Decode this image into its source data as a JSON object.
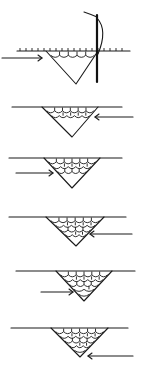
{
  "diagram": {
    "title": "",
    "type": "welding-pass-sequence",
    "canvas": {
      "width": 146,
      "height": 373,
      "background": "#ffffff",
      "ink": "#1a1a1a"
    },
    "panels": [
      {
        "step": 1,
        "surface": {
          "y": 51,
          "x1": 17,
          "x2": 130
        },
        "groove": {
          "left": 46,
          "right": 98,
          "apex_x": 76,
          "apex_y": 84
        },
        "fill_rows": 1,
        "arrow": {
          "direction": "right",
          "x1": 2,
          "x2": 42,
          "y": 58
        },
        "electrode": {
          "x": 97,
          "y1": 15,
          "y2": 82
        },
        "scallops_on_surface": true
      },
      {
        "step": 2,
        "surface": {
          "y": 107,
          "x1": 12,
          "x2": 122
        },
        "groove": {
          "left": 42,
          "right": 98,
          "apex_x": 72,
          "apex_y": 137
        },
        "fill_rows": 2,
        "arrow": {
          "direction": "left",
          "x1": 133,
          "x2": 95,
          "y": 117
        }
      },
      {
        "step": 3,
        "surface": {
          "y": 158,
          "x1": 9,
          "x2": 122
        },
        "groove": {
          "left": 44,
          "right": 100,
          "apex_x": 72,
          "apex_y": 188
        },
        "fill_rows": 3,
        "arrow": {
          "direction": "right",
          "x1": 16,
          "x2": 53,
          "y": 173
        }
      },
      {
        "step": 4,
        "surface": {
          "y": 217,
          "x1": 9,
          "x2": 126
        },
        "groove": {
          "left": 46,
          "right": 104,
          "apex_x": 76,
          "apex_y": 246
        },
        "fill_rows": 4,
        "arrow": {
          "direction": "left",
          "x1": 132,
          "x2": 90,
          "y": 234
        }
      },
      {
        "step": 5,
        "surface": {
          "y": 271,
          "x1": 16,
          "x2": 135
        },
        "groove": {
          "left": 56,
          "right": 112,
          "apex_x": 84,
          "apex_y": 301
        },
        "fill_rows": 5,
        "arrow": {
          "direction": "right",
          "x1": 41,
          "x2": 73,
          "y": 292
        }
      },
      {
        "step": 6,
        "surface": {
          "y": 328,
          "x1": 11,
          "x2": 128
        },
        "groove": {
          "left": 51,
          "right": 108,
          "apex_x": 80,
          "apex_y": 357
        },
        "fill_rows": 6,
        "arrow": {
          "direction": "left",
          "x1": 133,
          "x2": 88,
          "y": 356
        }
      }
    ]
  }
}
